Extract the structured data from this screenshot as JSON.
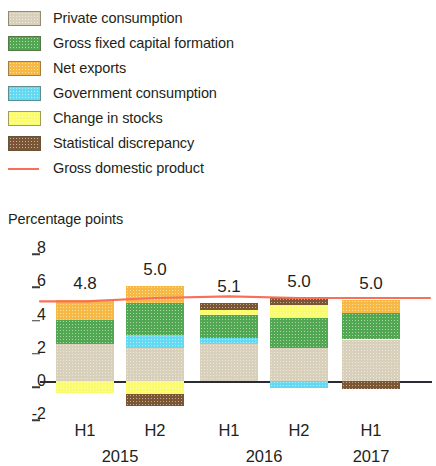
{
  "legend": {
    "items": [
      {
        "label": "Private consumption",
        "color": "#d8d0bb",
        "icon": "square-swatch-icon"
      },
      {
        "label": "Gross fixed capital formation",
        "color": "#52a852",
        "icon": "square-swatch-icon"
      },
      {
        "label": "Net exports",
        "color": "#f6b945",
        "icon": "square-swatch-icon"
      },
      {
        "label": "Government consumption",
        "color": "#66d9f2",
        "icon": "square-swatch-icon"
      },
      {
        "label": "Change in stocks",
        "color": "#fbfb6e",
        "icon": "square-swatch-icon"
      },
      {
        "label": "Statistical discrepancy",
        "color": "#7a5635",
        "icon": "square-swatch-icon"
      },
      {
        "label": "Gross domestic product",
        "color": "#f9705a",
        "icon": "line-swatch-icon"
      }
    ]
  },
  "axis_title": "Percentage points",
  "x_axis": {
    "periods": [
      "H1",
      "H2",
      "H1",
      "H2",
      "H1"
    ],
    "years": [
      {
        "label": "2015",
        "span_start": 0,
        "span_end": 1
      },
      {
        "label": "2016",
        "span_start": 2,
        "span_end": 3
      },
      {
        "label": "2017",
        "span_start": 4,
        "span_end": 4
      }
    ]
  },
  "chart_data": {
    "type": "bar",
    "stacked": true,
    "title": "",
    "subtitle": "",
    "xlabel": "",
    "ylabel": "Percentage points",
    "ylim": [
      -2.8,
      8.6
    ],
    "yticks": [
      8,
      6,
      4,
      2,
      0,
      -2
    ],
    "ytick_labels": [
      "8",
      "6",
      "4",
      "2",
      "0",
      "-2"
    ],
    "grid": false,
    "legend_position": "top-left",
    "categories": [
      "H1 2015",
      "H2 2015",
      "H1 2016",
      "H2 2016",
      "H1 2017"
    ],
    "series": [
      {
        "name": "Private consumption",
        "color": "#d8d0bb",
        "values": [
          2.2,
          2.0,
          2.2,
          2.0,
          2.5
        ]
      },
      {
        "name": "Gross fixed capital formation",
        "color": "#52a852",
        "values": [
          1.5,
          1.9,
          1.8,
          1.8,
          1.6
        ]
      },
      {
        "name": "Net exports",
        "color": "#f6b945",
        "values": [
          1.2,
          1.0,
          0.0,
          0.0,
          0.8
        ]
      },
      {
        "name": "Government consumption",
        "color": "#66d9f2",
        "values": [
          0.0,
          0.8,
          0.4,
          -0.4,
          0.0
        ]
      },
      {
        "name": "Change in stocks",
        "color": "#fbfb6e",
        "values": [
          -0.7,
          -0.8,
          0.3,
          0.8,
          0.0
        ]
      },
      {
        "name": "Statistical discrepancy",
        "color": "#7a5635",
        "values": [
          0.0,
          -0.7,
          0.4,
          0.4,
          -0.5
        ]
      }
    ],
    "gdp_line": {
      "name": "Gross domestic product",
      "color": "#f9705a",
      "values": [
        4.8,
        5.0,
        5.1,
        5.0,
        5.0
      ]
    },
    "bar_labels": [
      "4.8",
      "5.0",
      "5.1",
      "5.0",
      "5.0"
    ]
  },
  "bars": [
    {
      "category": "H1 2015",
      "value_label": "4.8",
      "segments": [
        {
          "name": "Net exports",
          "color": "#f6b945",
          "top_value": 4.9,
          "bottom_value": 3.7
        },
        {
          "name": "Gross fixed capital formation",
          "color": "#52a852",
          "top_value": 3.7,
          "bottom_value": 2.2
        },
        {
          "name": "Private consumption",
          "color": "#d8d0bb",
          "top_value": 2.2,
          "bottom_value": 0.0
        },
        {
          "name": "Change in stocks",
          "color": "#fbfb6e",
          "top_value": 0.0,
          "bottom_value": -0.7
        }
      ]
    },
    {
      "category": "H2 2015",
      "value_label": "5.0",
      "segments": [
        {
          "name": "Net exports",
          "color": "#f6b945",
          "top_value": 5.7,
          "bottom_value": 4.7
        },
        {
          "name": "Gross fixed capital formation",
          "color": "#52a852",
          "top_value": 4.7,
          "bottom_value": 2.8
        },
        {
          "name": "Government consumption",
          "color": "#66d9f2",
          "top_value": 2.8,
          "bottom_value": 2.0
        },
        {
          "name": "Private consumption",
          "color": "#d8d0bb",
          "top_value": 2.0,
          "bottom_value": 0.0
        },
        {
          "name": "Change in stocks",
          "color": "#fbfb6e",
          "top_value": 0.0,
          "bottom_value": -0.8
        },
        {
          "name": "Statistical discrepancy",
          "color": "#7a5635",
          "top_value": -0.8,
          "bottom_value": -1.5
        }
      ]
    },
    {
      "category": "H1 2016",
      "value_label": "5.1",
      "segments": [
        {
          "name": "Statistical discrepancy",
          "color": "#7a5635",
          "top_value": 4.7,
          "bottom_value": 4.3
        },
        {
          "name": "Change in stocks",
          "color": "#fbfb6e",
          "top_value": 4.3,
          "bottom_value": 4.0
        },
        {
          "name": "Gross fixed capital formation",
          "color": "#52a852",
          "top_value": 4.0,
          "bottom_value": 2.6
        },
        {
          "name": "Government consumption",
          "color": "#66d9f2",
          "top_value": 2.6,
          "bottom_value": 2.2
        },
        {
          "name": "Private consumption",
          "color": "#d8d0bb",
          "top_value": 2.2,
          "bottom_value": 0.0
        }
      ]
    },
    {
      "category": "H2 2016",
      "value_label": "5.0",
      "segments": [
        {
          "name": "Statistical discrepancy",
          "color": "#7a5635",
          "top_value": 5.0,
          "bottom_value": 4.6
        },
        {
          "name": "Change in stocks",
          "color": "#fbfb6e",
          "top_value": 4.6,
          "bottom_value": 3.8
        },
        {
          "name": "Gross fixed capital formation",
          "color": "#52a852",
          "top_value": 3.8,
          "bottom_value": 2.0
        },
        {
          "name": "Private consumption",
          "color": "#d8d0bb",
          "top_value": 2.0,
          "bottom_value": 0.0
        },
        {
          "name": "Government consumption",
          "color": "#66d9f2",
          "top_value": 0.0,
          "bottom_value": -0.4
        }
      ]
    },
    {
      "category": "H1 2017",
      "value_label": "5.0",
      "segments": [
        {
          "name": "Net exports",
          "color": "#f6b945",
          "top_value": 4.9,
          "bottom_value": 4.1
        },
        {
          "name": "Gross fixed capital formation",
          "color": "#52a852",
          "top_value": 4.1,
          "bottom_value": 2.5
        },
        {
          "name": "Private consumption",
          "color": "#d8d0bb",
          "top_value": 2.5,
          "bottom_value": 0.0
        },
        {
          "name": "Statistical discrepancy",
          "color": "#7a5635",
          "top_value": 0.0,
          "bottom_value": -0.5
        }
      ]
    }
  ]
}
